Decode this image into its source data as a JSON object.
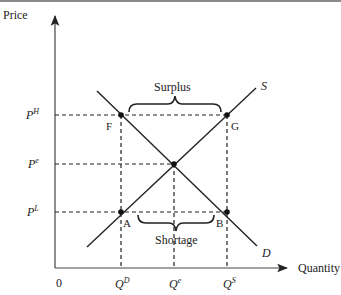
{
  "diagram": {
    "axes": {
      "y_label": "Price",
      "x_label": "Quantity",
      "origin_label": "0"
    },
    "price_levels": [
      {
        "id": "PH",
        "base": "P",
        "sup": "H"
      },
      {
        "id": "Pe",
        "base": "P",
        "sup": "e"
      },
      {
        "id": "PL",
        "base": "P",
        "sup": "L"
      }
    ],
    "quantity_levels": [
      {
        "id": "QD",
        "base": "Q",
        "sup": "D"
      },
      {
        "id": "Qe",
        "base": "Q",
        "sup": "e"
      },
      {
        "id": "QS",
        "base": "Q",
        "sup": "S"
      }
    ],
    "curves": {
      "supply": "S",
      "demand": "D"
    },
    "points": {
      "F": "F",
      "G": "G",
      "A": "A",
      "B": "B"
    },
    "annotations": {
      "surplus": "Surplus",
      "shortage": "Shortage"
    },
    "colors": {
      "line": "#222222",
      "axis": "#444444",
      "text": "#222222"
    }
  }
}
